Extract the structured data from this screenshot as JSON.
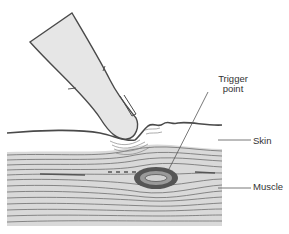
{
  "figure": {
    "labels": {
      "trigger_point_line1": "Trigger",
      "trigger_point_line2": "point",
      "skin": "Skin",
      "muscle": "Muscle"
    },
    "colors": {
      "outline": "#4a4a4a",
      "finger_fill": "#e6e6e6",
      "muscle_fill": "#d9d9d9",
      "muscle_fiber": "#6e6e6e",
      "nodule_dark": "#555555",
      "nodule_mid": "#9a9a9a",
      "leader_line": "#555555"
    }
  }
}
